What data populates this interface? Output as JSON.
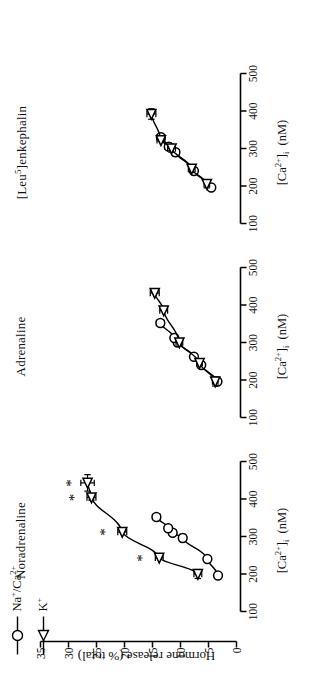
{
  "figure": {
    "orientation_deg": -90,
    "axis_color": "#000000",
    "xlabel_html": "[Ca2+]i  (nM)",
    "ylabel": "Hormone release (% total)",
    "xticks": [
      100,
      200,
      300,
      400,
      500
    ],
    "yticks": [
      0,
      5,
      10,
      15,
      20,
      25,
      30,
      35
    ],
    "xlim": [
      100,
      500
    ],
    "ylim": [
      0,
      35
    ],
    "significance_marker": "*"
  },
  "legend": {
    "position": "top-left",
    "entries": [
      {
        "label": "Na+/Ca2+",
        "marker": "circle",
        "marker_name": "open-circle-marker"
      },
      {
        "label": "K+",
        "marker": "triangle",
        "marker_name": "open-triangle-marker"
      }
    ]
  },
  "chart_data": [
    {
      "type": "line",
      "title": "Noradrenaline",
      "xlabel": "[Ca2+]i (nM)",
      "ylabel": "Hormone release (% total)",
      "xlim": [
        100,
        500
      ],
      "ylim": [
        0,
        35
      ],
      "grid": false,
      "legend_position": "figure top-left",
      "series": [
        {
          "name": "Na+/Ca2+",
          "marker": "circle",
          "points": [
            {
              "x": 196,
              "y": 3.3,
              "xerr": 0,
              "yerr": 0.4
            },
            {
              "x": 240,
              "y": 5.2,
              "xerr": 0,
              "yerr": 0.5
            },
            {
              "x": 296,
              "y": 9.6,
              "xerr": 10,
              "yerr": 0.6
            },
            {
              "x": 310,
              "y": 11.4,
              "xerr": 0,
              "yerr": 0.6
            },
            {
              "x": 322,
              "y": 12.2,
              "xerr": 0,
              "yerr": 0.6
            },
            {
              "x": 352,
              "y": 14.3,
              "xerr": 0,
              "yerr": 0.7
            }
          ]
        },
        {
          "name": "K+",
          "marker": "triangle",
          "points": [
            {
              "x": 200,
              "y": 6.9,
              "xerr": 12,
              "yerr": 0.7,
              "significant": false
            },
            {
              "x": 243,
              "y": 13.8,
              "xerr": 0,
              "yerr": 0.7,
              "significant": true
            },
            {
              "x": 312,
              "y": 20.4,
              "xerr": 0,
              "yerr": 0.8,
              "significant": true
            },
            {
              "x": 404,
              "y": 25.9,
              "xerr": 7,
              "yerr": 0.8,
              "significant": true
            },
            {
              "x": 443,
              "y": 26.6,
              "xerr": 22,
              "yerr": 1.2,
              "significant": true
            }
          ]
        }
      ]
    },
    {
      "type": "line",
      "title": "Adrenaline",
      "xlabel": "[Ca2+]i (nM)",
      "ylabel": "Hormone release (% total)",
      "xlim": [
        100,
        500
      ],
      "ylim": [
        0,
        35
      ],
      "grid": false,
      "series": [
        {
          "name": "Na+/Ca2+",
          "marker": "circle",
          "points": [
            {
              "x": 196,
              "y": 3.4,
              "xerr": 0,
              "yerr": 0.4
            },
            {
              "x": 240,
              "y": 6.3,
              "xerr": 0,
              "yerr": 0.5
            },
            {
              "x": 262,
              "y": 7.6,
              "xerr": 0,
              "yerr": 0.5
            },
            {
              "x": 300,
              "y": 10.5,
              "xerr": 10,
              "yerr": 0.6
            },
            {
              "x": 312,
              "y": 11.1,
              "xerr": 0,
              "yerr": 0.6
            },
            {
              "x": 352,
              "y": 13.6,
              "xerr": 0,
              "yerr": 0.7
            }
          ]
        },
        {
          "name": "K+",
          "marker": "triangle",
          "points": [
            {
              "x": 196,
              "y": 3.8,
              "xerr": 12,
              "yerr": 0.5
            },
            {
              "x": 245,
              "y": 6.6,
              "xerr": 0,
              "yerr": 0.5
            },
            {
              "x": 300,
              "y": 10.2,
              "xerr": 10,
              "yerr": 0.6
            },
            {
              "x": 385,
              "y": 13.0,
              "xerr": 0,
              "yerr": 0.7
            },
            {
              "x": 432,
              "y": 14.6,
              "xerr": 0,
              "yerr": 0.8
            }
          ]
        }
      ]
    },
    {
      "type": "line",
      "title": "[Leu5]enkephalin",
      "xlabel": "[Ca2+]i (nM)",
      "ylabel": "Hormone release (% total)",
      "xlim": [
        100,
        500
      ],
      "ylim": [
        0,
        35
      ],
      "grid": false,
      "series": [
        {
          "name": "Na+/Ca2+",
          "marker": "circle",
          "points": [
            {
              "x": 196,
              "y": 4.5,
              "xerr": 0,
              "yerr": 0.4
            },
            {
              "x": 240,
              "y": 7.6,
              "xerr": 0,
              "yerr": 0.5
            },
            {
              "x": 290,
              "y": 10.9,
              "xerr": 10,
              "yerr": 0.7
            },
            {
              "x": 305,
              "y": 12.1,
              "xerr": 10,
              "yerr": 0.7
            },
            {
              "x": 330,
              "y": 13.5,
              "xerr": 10,
              "yerr": 0.7
            }
          ]
        },
        {
          "name": "K+",
          "marker": "triangle",
          "points": [
            {
              "x": 205,
              "y": 5.3,
              "xerr": 10,
              "yerr": 0.5
            },
            {
              "x": 246,
              "y": 8.0,
              "xerr": 10,
              "yerr": 0.6
            },
            {
              "x": 300,
              "y": 11.6,
              "xerr": 10,
              "yerr": 0.7
            },
            {
              "x": 322,
              "y": 13.5,
              "xerr": 0,
              "yerr": 0.7
            },
            {
              "x": 392,
              "y": 15.2,
              "xerr": 14,
              "yerr": 0.8
            }
          ]
        }
      ]
    }
  ]
}
